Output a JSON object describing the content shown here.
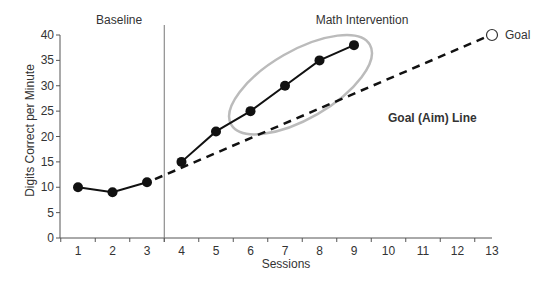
{
  "chart_data": {
    "type": "line",
    "title": "",
    "xlabel": "Sessions",
    "ylabel": "Digits Correct per Minute",
    "x": [
      1,
      2,
      3,
      4,
      5,
      6,
      7,
      8,
      9,
      10,
      11,
      12,
      13
    ],
    "ylim": [
      0,
      40
    ],
    "xlim": [
      0.5,
      13
    ],
    "yticks": [
      0,
      5,
      10,
      15,
      20,
      25,
      30,
      35,
      40
    ],
    "xticks": [
      1,
      2,
      3,
      4,
      5,
      6,
      7,
      8,
      9,
      10,
      11,
      12,
      13
    ],
    "grid": false,
    "phases": [
      {
        "label": "Baseline",
        "sessions": [
          1,
          2,
          3
        ]
      },
      {
        "label": "Math Intervention",
        "sessions": [
          4,
          5,
          6,
          7,
          8,
          9
        ]
      }
    ],
    "phase_line_x": 3.5,
    "series": [
      {
        "name": "Baseline",
        "x": [
          1,
          2,
          3
        ],
        "values": [
          10,
          9,
          11
        ]
      },
      {
        "name": "Math Intervention",
        "x": [
          4,
          5,
          6,
          7,
          8,
          9
        ],
        "values": [
          15,
          21,
          25,
          30,
          35,
          38
        ]
      },
      {
        "name": "Goal (Aim) Line",
        "style": "dashed",
        "x": [
          3,
          13
        ],
        "values": [
          11,
          40
        ]
      }
    ],
    "annotations": [
      {
        "text": "Goal",
        "x": 13,
        "y": 40,
        "marker": "open-circle"
      },
      {
        "text": "Goal (Aim) Line",
        "bold": true
      },
      {
        "text": "ellipse",
        "highlight_sessions": [
          6,
          7,
          8,
          9
        ],
        "color": "#bbbbbb"
      }
    ]
  }
}
